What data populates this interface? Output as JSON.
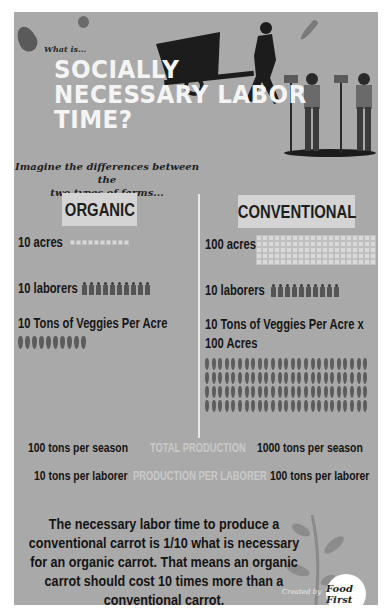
{
  "header": {
    "kicker": "What is...",
    "title_lines": [
      "SOCIALLY",
      "NECESSARY LABOR",
      "TIME?"
    ],
    "subtitle_lines": [
      "Imagine the differences between the",
      "two types of farms..."
    ]
  },
  "columns": {
    "organic": {
      "label": "ORGANIC",
      "acres": "10 acres",
      "acres_icon_count": 10,
      "laborers": "10 laborers",
      "laborer_icon_count": 10,
      "veggies": "10 Tons of Veggies Per Acre",
      "veggies_icon_count": 10
    },
    "conventional": {
      "label": "CONVENTIONAL",
      "acres": "100 acres",
      "acres_grid": {
        "columns": 20,
        "rows": 5
      },
      "laborers": "10 laborers",
      "laborer_icon_count": 10,
      "veggies_line1": "10 Tons of Veggies Per Acre x",
      "veggies_line2": "100 Acres",
      "veggies_grid": {
        "columns": 25,
        "rows": 4
      }
    }
  },
  "stats": {
    "total_production": {
      "label": "TOTAL PRODUCTION",
      "organic": "100 tons per season",
      "conventional": "1000 tons per season"
    },
    "production_per_laborer": {
      "label": "PRODUCTION PER LABORER",
      "organic": "10 tons per laborer",
      "conventional": "100 tons per laborer"
    }
  },
  "conclusion_lines": [
    "The necessary labor time to produce a",
    "conventional carrot is 1/10 what is necessary",
    "for an organic carrot. That means an organic",
    "carrot should cost 10 times more than a",
    "conventional carrot."
  ],
  "credit": {
    "created_by": "Created by",
    "logo_text": "Food First"
  },
  "colors": {
    "panel_bg": "#a9a9a9",
    "title_text": "#f4f4f4",
    "label_box": "#d4d4d4",
    "dark_text": "#161616",
    "muted_label": "#c9c9c9"
  }
}
